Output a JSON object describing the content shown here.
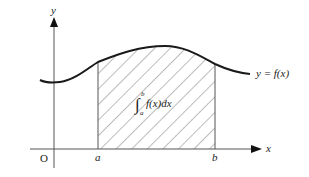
{
  "diagram": {
    "type": "definite-integral-area",
    "axes": {
      "x_label": "x",
      "y_label": "y",
      "origin_label": "O"
    },
    "bounds": {
      "lower_label": "a",
      "upper_label": "b"
    },
    "curve_label": "y = f(x)",
    "integral": {
      "symbol": "∫",
      "lower": "a",
      "upper": "b",
      "integrand": "f(x)dx"
    },
    "colors": {
      "curve": "#1a1a1a",
      "axes": "#555555",
      "hatch": "#555555",
      "background": "#ffffff"
    }
  }
}
